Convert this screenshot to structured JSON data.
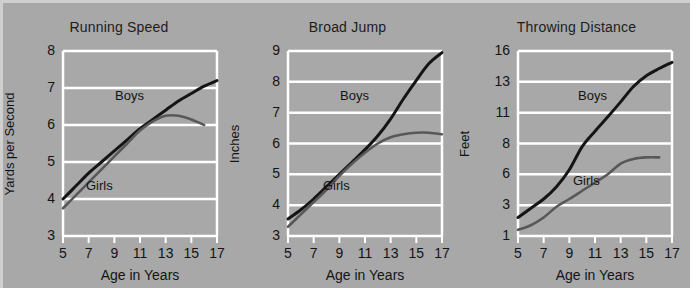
{
  "figure": {
    "background_color": "#a8a8a8",
    "grid_color": "#ffffff",
    "boys_color": "#151515",
    "girls_color": "#585858"
  },
  "chart_data": [
    {
      "type": "line",
      "title": "Running Speed",
      "xlabel": "Age in Years",
      "ylabel": "Yards per Second",
      "xticks": [
        5,
        7,
        9,
        11,
        13,
        15,
        17
      ],
      "xtick_labels": [
        "5",
        "7",
        "9",
        "11",
        "13",
        "15",
        "17"
      ],
      "yticks": [
        3,
        4,
        5,
        6,
        7,
        8
      ],
      "ytick_labels": [
        "3",
        "4",
        "5",
        "6",
        "7",
        "8"
      ],
      "xlim": [
        5,
        17
      ],
      "ylim": [
        3,
        8
      ],
      "grid": true,
      "legend_position": "inline-annotation",
      "series": [
        {
          "name": "Boys",
          "x": [
            5,
            6,
            7,
            8,
            9,
            10,
            11,
            12,
            13,
            14,
            15,
            16,
            17
          ],
          "values": [
            4.0,
            4.35,
            4.7,
            5.0,
            5.3,
            5.6,
            5.9,
            6.15,
            6.4,
            6.65,
            6.85,
            7.05,
            7.2
          ]
        },
        {
          "name": "Girls",
          "x": [
            5,
            6,
            7,
            8,
            9,
            10,
            11,
            12,
            13,
            14,
            15,
            16
          ],
          "values": [
            3.75,
            4.1,
            4.45,
            4.8,
            5.15,
            5.5,
            5.85,
            6.1,
            6.25,
            6.25,
            6.15,
            6.0
          ]
        }
      ]
    },
    {
      "type": "line",
      "title": "Broad Jump",
      "xlabel": "Age in Years",
      "ylabel": "Inches",
      "xticks": [
        5,
        7,
        9,
        11,
        13,
        15,
        17
      ],
      "xtick_labels": [
        "5",
        "7",
        "9",
        "11",
        "13",
        "15",
        "17"
      ],
      "yticks": [
        3,
        4,
        5,
        6,
        7,
        8,
        9
      ],
      "ytick_labels": [
        "3",
        "4",
        "5",
        "6",
        "7",
        "8",
        "9"
      ],
      "xlim": [
        5,
        17
      ],
      "ylim": [
        3,
        9
      ],
      "grid": true,
      "legend_position": "inline-annotation",
      "series": [
        {
          "name": "Boys",
          "x": [
            5,
            6,
            7,
            8,
            9,
            10,
            11,
            12,
            13,
            14,
            15,
            16,
            17
          ],
          "values": [
            3.55,
            3.85,
            4.2,
            4.6,
            5.0,
            5.4,
            5.8,
            6.25,
            6.8,
            7.45,
            8.05,
            8.6,
            8.95
          ]
        },
        {
          "name": "Girls",
          "x": [
            5,
            6,
            7,
            8,
            9,
            10,
            11,
            12,
            13,
            14,
            15,
            16,
            17
          ],
          "values": [
            3.3,
            3.7,
            4.1,
            4.5,
            4.95,
            5.35,
            5.7,
            6.0,
            6.2,
            6.3,
            6.35,
            6.35,
            6.3
          ]
        }
      ]
    },
    {
      "type": "line",
      "title": "Throwing Distance",
      "xlabel": "Age in Years",
      "ylabel": "Feet",
      "xticks": [
        5,
        7,
        9,
        11,
        13,
        15,
        17
      ],
      "xtick_labels": [
        "5",
        "7",
        "9",
        "11",
        "13",
        "15",
        "17"
      ],
      "yticks": [
        1,
        3,
        6,
        8,
        11,
        13,
        16
      ],
      "ytick_labels": [
        "1",
        "3",
        "6",
        "8",
        "11",
        "13",
        "16"
      ],
      "xlim": [
        5,
        17
      ],
      "ylim": [
        1,
        16
      ],
      "grid": true,
      "legend_position": "inline-annotation",
      "series": [
        {
          "name": "Boys",
          "x": [
            5,
            6,
            7,
            8,
            9,
            10,
            11,
            12,
            13,
            14,
            15,
            16,
            17
          ],
          "values": [
            2.2,
            2.8,
            3.6,
            4.8,
            6.3,
            7.8,
            9.2,
            10.6,
            11.7,
            12.7,
            13.6,
            14.3,
            14.9
          ]
        },
        {
          "name": "Girls",
          "x": [
            5,
            6,
            7,
            8,
            9,
            10,
            11,
            12,
            13,
            14,
            15,
            16
          ],
          "values": [
            1.4,
            1.7,
            2.2,
            2.9,
            3.6,
            4.4,
            5.2,
            6.0,
            6.7,
            7.0,
            7.1,
            7.1
          ]
        }
      ]
    }
  ]
}
